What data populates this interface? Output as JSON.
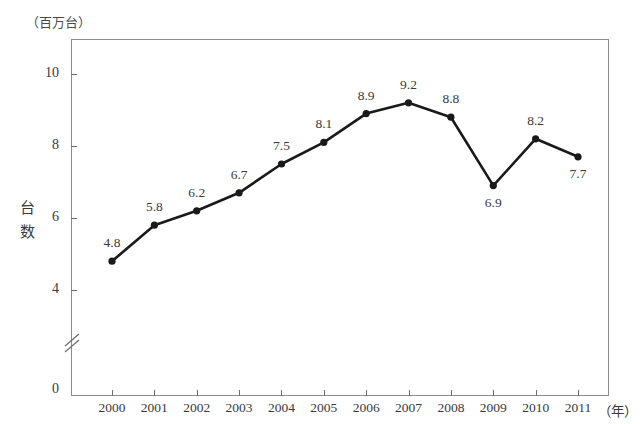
{
  "chart_data": {
    "type": "line",
    "title": "",
    "unit_note": "（百万台）",
    "xlabel": "（年）",
    "ylabel": "台数",
    "categories": [
      "2000",
      "2001",
      "2002",
      "2003",
      "2004",
      "2005",
      "2006",
      "2007",
      "2008",
      "2009",
      "2010",
      "2011"
    ],
    "values": [
      4.8,
      5.8,
      6.2,
      6.7,
      7.5,
      8.1,
      8.9,
      9.2,
      8.8,
      6.9,
      8.2,
      7.7
    ],
    "point_labels": [
      "4.8",
      "5.8",
      "6.2",
      "6.7",
      "7.5",
      "8.1",
      "8.9",
      "9.2",
      "8.8",
      "6.9",
      "8.2",
      "7.7"
    ],
    "label_positions": [
      "above",
      "above",
      "above",
      "above",
      "above",
      "above",
      "above",
      "above",
      "above",
      "below",
      "above",
      "below"
    ],
    "y_ticks": [
      "0",
      "4",
      "6",
      "8",
      "10"
    ],
    "y_tick_values": [
      0,
      4,
      6,
      8,
      10
    ],
    "ylim": [
      0,
      11
    ],
    "axis_break": true,
    "axis_break_between": [
      0,
      4
    ],
    "grid": false,
    "legend": "none",
    "series_color": "#1a1a1a",
    "frame_color": "#8d8d8d",
    "marker": "filled-circle"
  },
  "y_axis": {
    "unit": "（百万台）",
    "title_chars": [
      "台",
      "数"
    ],
    "ticks": [
      {
        "label": "10",
        "value": 10
      },
      {
        "label": "8",
        "value": 8
      },
      {
        "label": "6",
        "value": 6
      },
      {
        "label": "4",
        "value": 4
      },
      {
        "label": "0",
        "value": 0
      }
    ]
  },
  "x_axis": {
    "unit": "（年）",
    "ticks": [
      "2000",
      "2001",
      "2002",
      "2003",
      "2004",
      "2005",
      "2006",
      "2007",
      "2008",
      "2009",
      "2010",
      "2011"
    ]
  }
}
